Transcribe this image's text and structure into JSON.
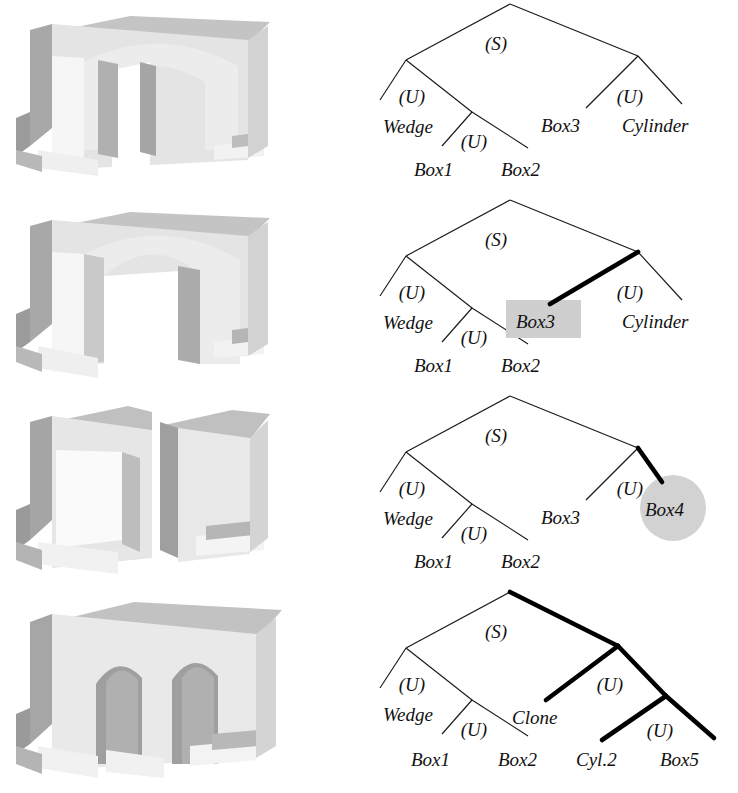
{
  "figure": {
    "background": "#ffffff",
    "highlight_gray": "#cfcfcf",
    "bold_edge_color": "#000000",
    "thin_edge_color": "#1a1a1a",
    "rows": 4
  },
  "rows": [
    {
      "id": "row-1",
      "render": {
        "name": "arch-with-round-top-two-piers",
        "caption": ""
      },
      "tree": {
        "root": "(S)",
        "operators": [
          "(S)",
          "(U)",
          "(U)",
          "(U)"
        ],
        "leaves": [
          "Wedge",
          "Box1",
          "Box2",
          "Box3",
          "Cylinder"
        ],
        "op_left": "(U)",
        "op_left_inner": "(U)",
        "op_right": "(U)",
        "highlight": null,
        "bold_edges": []
      }
    },
    {
      "id": "row-2",
      "render": {
        "name": "arch-with-round-top-opened-span",
        "caption": ""
      },
      "tree": {
        "root": "(S)",
        "operators": [
          "(S)",
          "(U)",
          "(U)",
          "(U)"
        ],
        "leaves": [
          "Wedge",
          "Box1",
          "Box2",
          "Box3",
          "Cylinder"
        ],
        "op_left": "(U)",
        "op_left_inner": "(U)",
        "op_right": "(U)",
        "highlight": {
          "shape": "rect",
          "label": "Box3"
        },
        "bold_edges": [
          "right-union-to-Box3"
        ]
      }
    },
    {
      "id": "row-3",
      "render": {
        "name": "two-separate-blocks-no-arch",
        "caption": ""
      },
      "tree": {
        "root": "(S)",
        "operators": [
          "(S)",
          "(U)",
          "(U)",
          "(U)"
        ],
        "leaves": [
          "Wedge",
          "Box1",
          "Box2",
          "Box3",
          "Box4"
        ],
        "op_left": "(U)",
        "op_left_inner": "(U)",
        "op_right": "(U)",
        "highlight": {
          "shape": "circle",
          "label": "Box4"
        },
        "bold_edges": [
          "right-union-to-Box4"
        ]
      }
    },
    {
      "id": "row-4",
      "render": {
        "name": "double-arch-viaduct",
        "caption": ""
      },
      "tree": {
        "root": "(S)",
        "operators": [
          "(S)",
          "(U)",
          "(U)",
          "(U)",
          "(U)"
        ],
        "leaves": [
          "Wedge",
          "Box1",
          "Box2",
          "Clone",
          "Cyl.2",
          "Box5"
        ],
        "op_left": "(U)",
        "op_left_inner": "(U)",
        "op_right": "(U)",
        "op_right_inner": "(U)",
        "highlight": null,
        "bold_edges": [
          "root-to-right-union",
          "right-union-to-Clone",
          "right-union-to-right-inner-union",
          "right-inner-union-to-Cyl.2",
          "right-inner-union-to-Box5"
        ]
      }
    }
  ],
  "labels": {
    "S": "(S)",
    "U": "(U)",
    "wedge": "Wedge",
    "box1": "Box1",
    "box2": "Box2",
    "box3": "Box3",
    "box4": "Box4",
    "box5": "Box5",
    "cylinder": "Cylinder",
    "clone": "Clone",
    "cyl2": "Cyl.2"
  }
}
